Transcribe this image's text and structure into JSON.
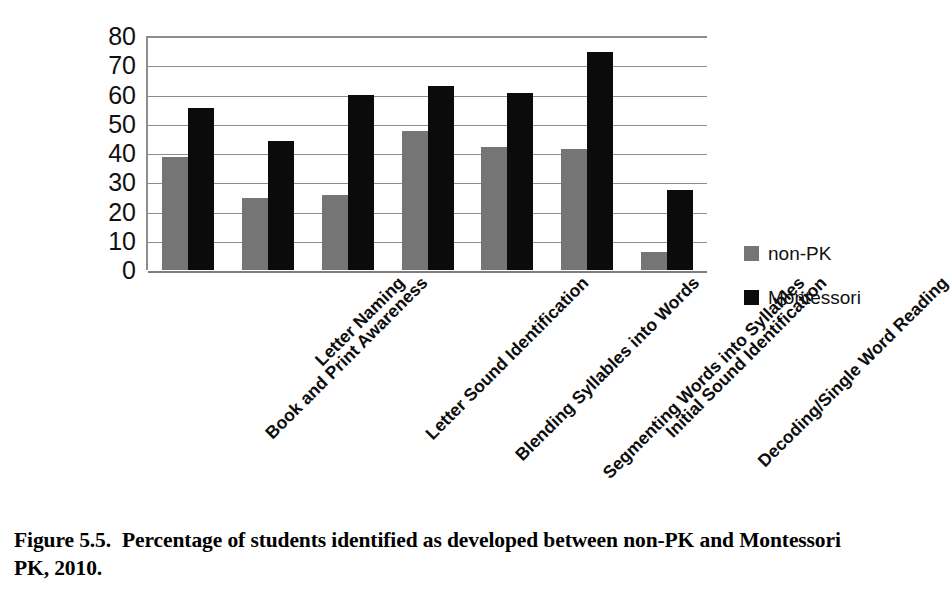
{
  "figure": {
    "caption_number": "Figure 5.5.",
    "caption_text": "Percentage of students identified as developed between non-PK and Montessori PK, 2010."
  },
  "legend": {
    "items": [
      {
        "label": "non-PK",
        "color": "#757575",
        "swatch": "square-swatch-gray"
      },
      {
        "label": "Montessori",
        "color": "#0b0b0b",
        "swatch": "square-swatch-black"
      }
    ]
  },
  "axis": {
    "y_ticks": [
      "80",
      "70",
      "60",
      "50",
      "40",
      "30",
      "20",
      "10",
      "0"
    ]
  },
  "chart_data": {
    "type": "bar",
    "title": "",
    "subtitle": "",
    "xlabel": "",
    "ylabel": "",
    "ylim": [
      0,
      80
    ],
    "ytick_step": 10,
    "grid": true,
    "legend_position": "right",
    "categories": [
      "Book and Print Awareness",
      "Letter Naming",
      "Letter Sound Identification",
      "Blending Syllables into Words",
      "Segmenting Words into Syllables",
      "Initial Sound Identification",
      "Decoding/Single Word Reading"
    ],
    "series": [
      {
        "name": "non-PK",
        "color": "#757575",
        "values": [
          38.5,
          24.5,
          25.5,
          47.5,
          42,
          41.5,
          6
        ]
      },
      {
        "name": "Montessori",
        "color": "#0b0b0b",
        "values": [
          55.5,
          44,
          60,
          63,
          60.5,
          74.5,
          27.5
        ]
      }
    ]
  }
}
